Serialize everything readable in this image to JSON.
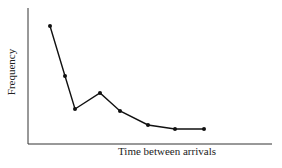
{
  "chart_data": {
    "type": "line",
    "title": "",
    "xlabel": "Time between arrivals",
    "ylabel": "Frequency",
    "grid": false,
    "legend": null,
    "x": [
      1,
      2,
      3,
      4,
      5,
      6,
      7,
      8
    ],
    "values": [
      100,
      58,
      30,
      43,
      28,
      16,
      13,
      13
    ],
    "ylim": [
      0,
      110
    ],
    "marker": "filled-circle",
    "line_color": "#111111",
    "pixel_points": [
      [
        50,
        26
      ],
      [
        65,
        76
      ],
      [
        75,
        109
      ],
      [
        100,
        93
      ],
      [
        120,
        111
      ],
      [
        148,
        125
      ],
      [
        175,
        129
      ],
      [
        204,
        129
      ]
    ]
  }
}
